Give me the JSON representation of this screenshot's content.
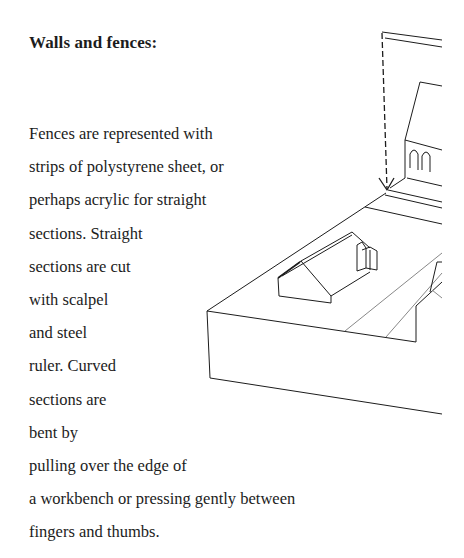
{
  "heading": "Walls and fences:",
  "body_lines": [
    "Fences are represented with",
    "strips of polystyrene sheet, or",
    "perhaps acrylic for straight",
    "sections. Straight",
    "sections are cut",
    "with scalpel",
    "and steel",
    "ruler. Curved",
    "sections are",
    "bent by",
    "pulling over the edge of",
    "a workbench or pressing gently between",
    "fingers and thumbs."
  ],
  "illustration": {
    "description": "Line drawing of a model baseboard with a house, church-like building and road, with a dashed arrow pointing down to the fence line",
    "stroke_color": "#1c1c1c"
  }
}
